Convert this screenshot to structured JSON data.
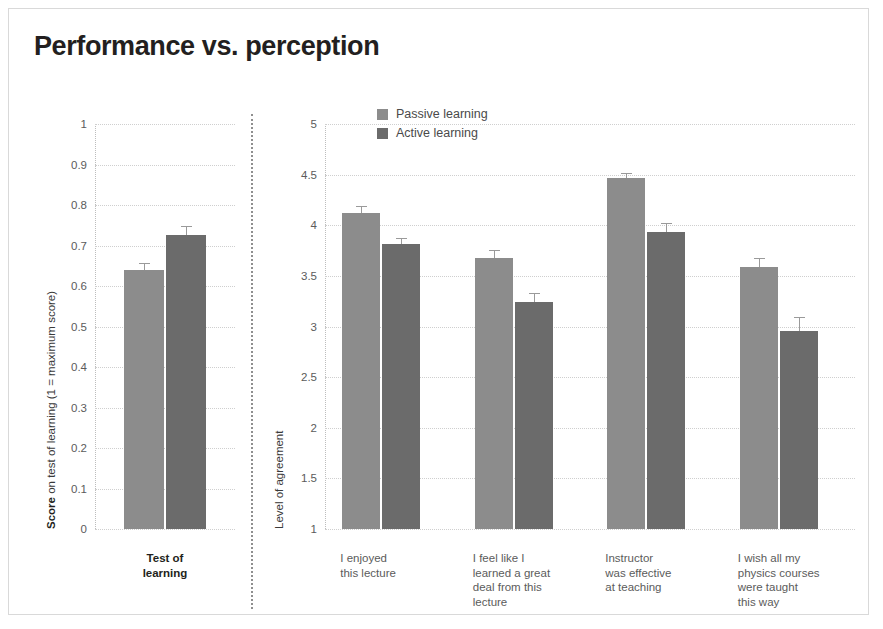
{
  "figure": {
    "title": "Performance vs. perception"
  },
  "legend": {
    "items": [
      {
        "label": "Passive learning",
        "color": "#8c8c8c"
      },
      {
        "label": "Active learning",
        "color": "#6b6b6b"
      }
    ]
  },
  "chart_data": [
    {
      "type": "bar",
      "id": "test-of-learning",
      "title": "",
      "xlabel": "",
      "ylabel": "Score on test of learning (1 = maximum score)",
      "ylabel_bold_prefix": "Score",
      "ylabel_rest": " on test of learning (1 = maximum score)",
      "categories": [
        "Test of learning"
      ],
      "category_lines": [
        [
          "Test of",
          "learning"
        ]
      ],
      "ylim": [
        0,
        1
      ],
      "yticks": [
        0,
        0.1,
        0.2,
        0.3,
        0.4,
        0.5,
        0.6,
        0.7,
        0.8,
        0.9,
        1
      ],
      "yticklabels": [
        "0",
        "0.1",
        "0.2",
        "0.3",
        "0.4",
        "0.5",
        "0.6",
        "0.7",
        "0.8",
        "0.9",
        "1"
      ],
      "grid": true,
      "series": [
        {
          "name": "Passive learning",
          "color": "#8c8c8c",
          "values": [
            0.64
          ],
          "errors": [
            0.017
          ]
        },
        {
          "name": "Active learning",
          "color": "#6b6b6b",
          "values": [
            0.725
          ],
          "errors": [
            0.022
          ]
        }
      ]
    },
    {
      "type": "bar",
      "id": "level-of-agreement",
      "title": "",
      "xlabel": "",
      "ylabel": "Level of agreement",
      "categories": [
        "I enjoyed this lecture",
        "I feel like I learned a great deal from this lecture",
        "Instructor was effective at teaching",
        "I wish all my physics courses were taught this way"
      ],
      "category_lines": [
        [
          "I enjoyed",
          "this lecture"
        ],
        [
          "I feel like I",
          "learned a great",
          "deal from this",
          "lecture"
        ],
        [
          "Instructor",
          "was effective",
          "at teaching"
        ],
        [
          "I wish all my",
          "physics courses",
          "were taught",
          "this way"
        ]
      ],
      "ylim": [
        1,
        5
      ],
      "yticks": [
        1,
        1.5,
        2,
        2.5,
        3,
        3.5,
        4,
        4.5,
        5
      ],
      "yticklabels": [
        "1",
        "1.5",
        "2",
        "2.5",
        "3",
        "3.5",
        "4",
        "4.5",
        "5"
      ],
      "grid": true,
      "legend_position": "top-left",
      "series": [
        {
          "name": "Passive learning",
          "color": "#8c8c8c",
          "values": [
            4.12,
            3.68,
            4.47,
            3.59
          ],
          "errors": [
            0.07,
            0.08,
            0.05,
            0.09
          ]
        },
        {
          "name": "Active learning",
          "color": "#6b6b6b",
          "values": [
            3.81,
            3.24,
            3.93,
            2.96
          ],
          "errors": [
            0.06,
            0.09,
            0.09,
            0.13
          ]
        }
      ]
    }
  ]
}
